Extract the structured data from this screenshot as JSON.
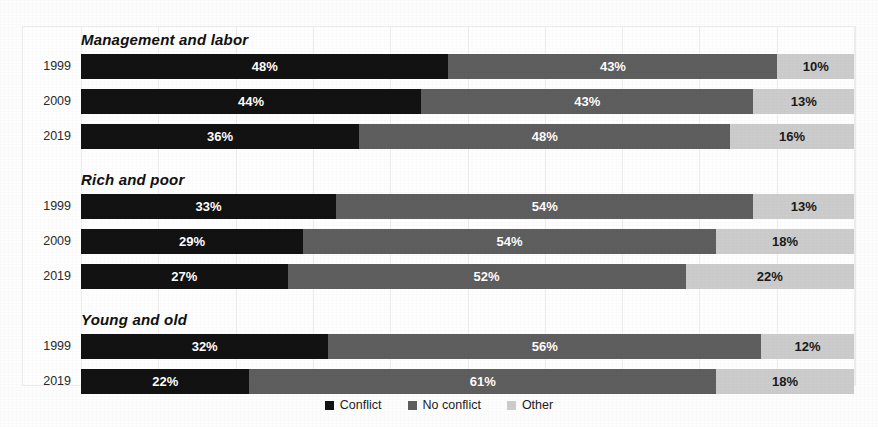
{
  "cropped_top_title": "........ ...... ..... ...",
  "chart_data": {
    "type": "bar",
    "orientation": "horizontal",
    "stacked": true,
    "normalized_percent": true,
    "title": "",
    "xlabel": "",
    "ylabel": "",
    "xlim": [
      0,
      100
    ],
    "grid": true,
    "legend_position": "bottom-center",
    "series": [
      {
        "name": "Conflict",
        "color": "#121212"
      },
      {
        "name": "No conflict",
        "color": "#5e5e5e"
      },
      {
        "name": "Other",
        "color": "#cccccc"
      }
    ],
    "groups": [
      {
        "label": "Management and labor",
        "rows": [
          {
            "category": "1999",
            "values": [
              48,
              43,
              10
            ],
            "labels": [
              "48%",
              "43%",
              "10%"
            ]
          },
          {
            "category": "2009",
            "values": [
              44,
              43,
              13
            ],
            "labels": [
              "44%",
              "43%",
              "13%"
            ]
          },
          {
            "category": "2019",
            "values": [
              36,
              48,
              16
            ],
            "labels": [
              "36%",
              "48%",
              "16%"
            ]
          }
        ]
      },
      {
        "label": "Rich and poor",
        "rows": [
          {
            "category": "1999",
            "values": [
              33,
              54,
              13
            ],
            "labels": [
              "33%",
              "54%",
              "13%"
            ]
          },
          {
            "category": "2009",
            "values": [
              29,
              54,
              18
            ],
            "labels": [
              "29%",
              "54%",
              "18%"
            ]
          },
          {
            "category": "2019",
            "values": [
              27,
              52,
              22
            ],
            "labels": [
              "27%",
              "52%",
              "22%"
            ]
          }
        ]
      },
      {
        "label": "Young and old",
        "rows": [
          {
            "category": "1999",
            "values": [
              32,
              56,
              12
            ],
            "labels": [
              "32%",
              "56%",
              "12%"
            ]
          },
          {
            "category": "2019",
            "values": [
              22,
              61,
              18
            ],
            "labels": [
              "22%",
              "61%",
              "18%"
            ]
          }
        ]
      }
    ],
    "legend": [
      "Conflict",
      "No conflict",
      "Other"
    ]
  }
}
